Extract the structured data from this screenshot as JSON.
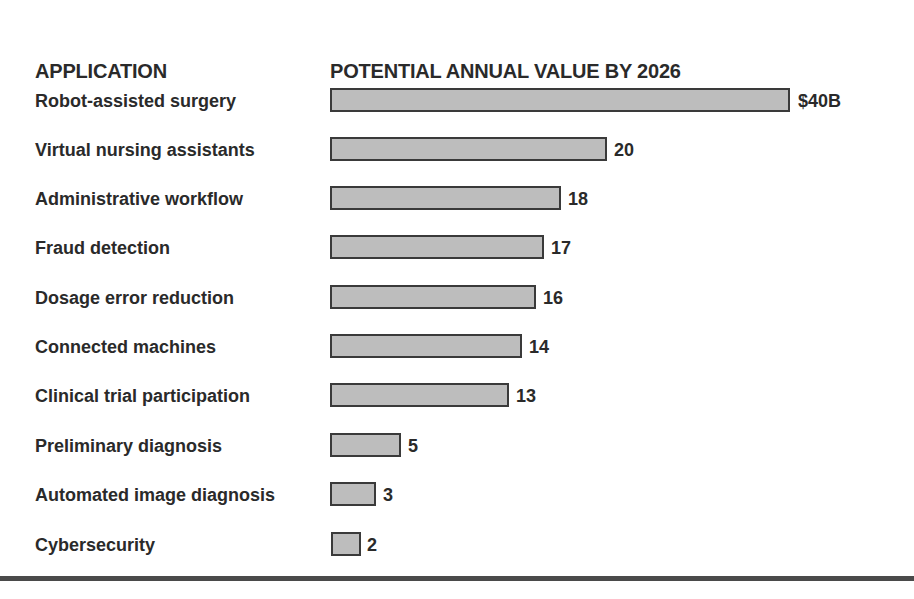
{
  "headers": {
    "application": "APPLICATION",
    "value": "POTENTIAL ANNUAL VALUE BY 2026"
  },
  "rows": [
    {
      "label": "Robot-assisted surgery",
      "value_label": "$40B",
      "value": 40,
      "bar_px": 460,
      "y": 86
    },
    {
      "label": "Virtual nursing assistants",
      "value_label": "20",
      "value": 20,
      "bar_px": 277,
      "y": 135
    },
    {
      "label": "Administrative workflow",
      "value_label": "18",
      "value": 18,
      "bar_px": 231,
      "y": 184
    },
    {
      "label": "Fraud detection",
      "value_label": "17",
      "value": 17,
      "bar_px": 214,
      "y": 233
    },
    {
      "label": "Dosage error reduction",
      "value_label": "16",
      "value": 16,
      "bar_px": 206,
      "y": 283
    },
    {
      "label": "Connected machines",
      "value_label": "14",
      "value": 14,
      "bar_px": 192,
      "y": 332
    },
    {
      "label": "Clinical trial participation",
      "value_label": "13",
      "value": 13,
      "bar_px": 179,
      "y": 381
    },
    {
      "label": "Preliminary diagnosis",
      "value_label": "5",
      "value": 5,
      "bar_px": 71,
      "y": 431
    },
    {
      "label": "Automated image diagnosis",
      "value_label": "3",
      "value": 3,
      "bar_px": 46,
      "y": 480
    },
    {
      "label": "Cybersecurity",
      "value_label": "2",
      "value": 2,
      "bar_px": 30,
      "y": 530
    }
  ],
  "chart_data": {
    "type": "bar",
    "orientation": "horizontal",
    "title": "POTENTIAL ANNUAL VALUE BY 2026",
    "xlabel": "Potential annual value (USD billions)",
    "ylabel": "APPLICATION",
    "categories": [
      "Robot-assisted surgery",
      "Virtual nursing assistants",
      "Administrative workflow",
      "Fraud detection",
      "Dosage error reduction",
      "Connected machines",
      "Clinical trial participation",
      "Preliminary diagnosis",
      "Automated image diagnosis",
      "Cybersecurity"
    ],
    "values": [
      40,
      20,
      18,
      17,
      16,
      14,
      13,
      5,
      3,
      2
    ],
    "value_labels": [
      "$40B",
      "20",
      "18",
      "17",
      "16",
      "14",
      "13",
      "5",
      "3",
      "2"
    ],
    "units": "USD billions",
    "grid": false,
    "legend": null,
    "axis_visible": false,
    "note": "Bar lengths as drawn are not proportional to the labeled values (e.g., the 20 bar is ~60% of the 40 bar). Rendered widths follow the source pixels."
  }
}
